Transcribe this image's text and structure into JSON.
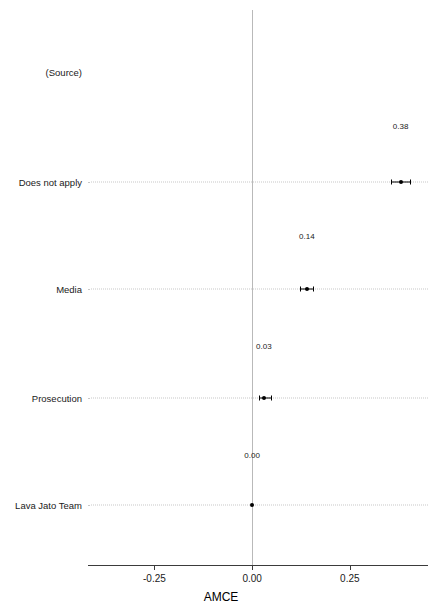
{
  "chart_data": {
    "type": "scatter",
    "title": "",
    "xlabel": "AMCE",
    "ylabel": "",
    "grid": false,
    "legend": null,
    "xlim": [
      -0.42,
      0.45
    ],
    "xticks": [
      -0.25,
      0.0,
      0.25
    ],
    "xticklabels": [
      "-0.25",
      "0.00",
      "0.25"
    ],
    "group_label": "(Source)",
    "reference_line": 0.0,
    "categories": [
      "Does not apply",
      "Media",
      "Prosecution",
      "Lava Jato Team"
    ],
    "values": [
      0.38,
      0.14,
      0.03,
      0.0
    ],
    "value_labels": [
      "0.38",
      "0.14",
      "0.03",
      "0.00"
    ],
    "ci_low": [
      0.355,
      0.122,
      0.018,
      0.0
    ],
    "ci_high": [
      0.405,
      0.157,
      0.048,
      0.0
    ]
  },
  "axis": {
    "x_title": "AMCE"
  }
}
